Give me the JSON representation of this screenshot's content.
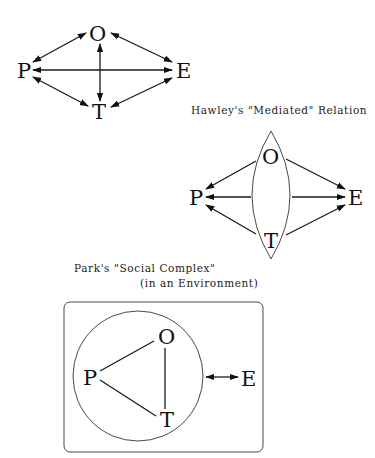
{
  "diagrams": [
    {
      "id": "direct",
      "title": "",
      "nodes": {
        "P": "P",
        "O": "O",
        "E": "E",
        "T": "T"
      },
      "edges": [
        {
          "from": "P",
          "to": "O",
          "arrows": "both"
        },
        {
          "from": "O",
          "to": "E",
          "arrows": "both"
        },
        {
          "from": "P",
          "to": "E",
          "arrows": "both"
        },
        {
          "from": "P",
          "to": "T",
          "arrows": "both"
        },
        {
          "from": "T",
          "to": "E",
          "arrows": "both"
        },
        {
          "from": "O",
          "to": "T",
          "arrows": "both"
        }
      ]
    },
    {
      "id": "hawley",
      "title": "Hawley's \"Mediated\" Relation",
      "nodes": {
        "P": "P",
        "O": "O",
        "E": "E",
        "T": "T"
      },
      "container": "lens enclosing O and T",
      "edges": [
        {
          "from": "lens",
          "to": "P",
          "arrows": "to-P"
        },
        {
          "from": "lens",
          "to": "E",
          "arrows": "to-E"
        }
      ]
    },
    {
      "id": "park",
      "title_line1": "Park's \"Social Complex\"",
      "title_line2": "(in an Environment)",
      "nodes": {
        "P": "P",
        "O": "O",
        "E": "E",
        "T": "T"
      },
      "container": "circle enclosing P, O, T inside rounded rectangle",
      "edges": [
        {
          "from": "P",
          "to": "O",
          "arrows": "none"
        },
        {
          "from": "P",
          "to": "T",
          "arrows": "none"
        },
        {
          "from": "O",
          "to": "T",
          "arrows": "none"
        },
        {
          "from": "circle",
          "to": "E",
          "arrows": "both"
        }
      ]
    }
  ],
  "colors": {
    "ink": "#111111",
    "background": "#ffffff"
  }
}
